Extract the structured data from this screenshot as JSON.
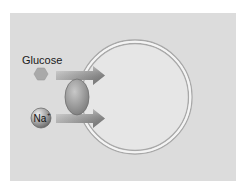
{
  "diagram": {
    "labels": {
      "glucose": "Glucose",
      "sodium": "Na",
      "sodium_charge": "+"
    },
    "elements": [
      {
        "name": "cell",
        "shape": "circle-double-membrane"
      },
      {
        "name": "glucose-molecule",
        "shape": "hexagon"
      },
      {
        "name": "sodium-ion",
        "shape": "sphere"
      },
      {
        "name": "cotransporter-protein",
        "shape": "ellipse"
      },
      {
        "name": "glucose-flow-arrow",
        "direction": "right"
      },
      {
        "name": "sodium-flow-arrow",
        "direction": "right"
      }
    ],
    "colors": {
      "background": "#dcdcdc",
      "cell_fill": "#e6e6e6",
      "membrane": "#a8a8a8",
      "hexagon": "#a9a9a9",
      "arrow": "#8c8c8c",
      "protein": "#9a9a9a",
      "ion": "#888888"
    }
  }
}
